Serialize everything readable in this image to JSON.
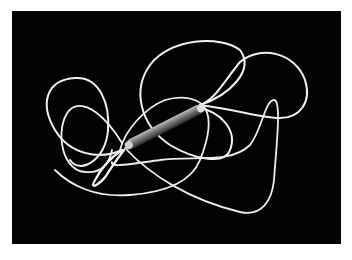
{
  "image": {
    "subject": "tangled white cable with cylindrical connector on black background",
    "colors": {
      "background": "#030303",
      "frame": "#ffffff",
      "wire": "#f2f2f2",
      "connector": "#8a8a8a"
    }
  }
}
